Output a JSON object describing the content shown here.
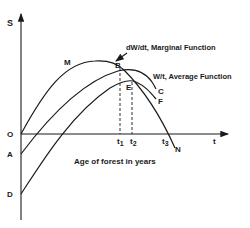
{
  "diagram": {
    "axes": {
      "y_label": "S",
      "x_label": "t",
      "x_title": "Age of forest in years",
      "origin_label": "O"
    },
    "intercepts": {
      "a": "A",
      "d": "D"
    },
    "points": {
      "m": "M",
      "b": "B",
      "e": "E",
      "c": "C",
      "f": "F",
      "n": "N"
    },
    "ticks": {
      "t1": "t",
      "t1_sub": "1",
      "t2": "t",
      "t2_sub": "2",
      "t3": "t",
      "t3_sub": "3"
    },
    "curve_labels": {
      "marginal": "dW/dt, Marginal Function",
      "average": "W/t, Average Function"
    },
    "colors": {
      "ink": "#1a1a1a",
      "background": "#ffffff"
    }
  }
}
